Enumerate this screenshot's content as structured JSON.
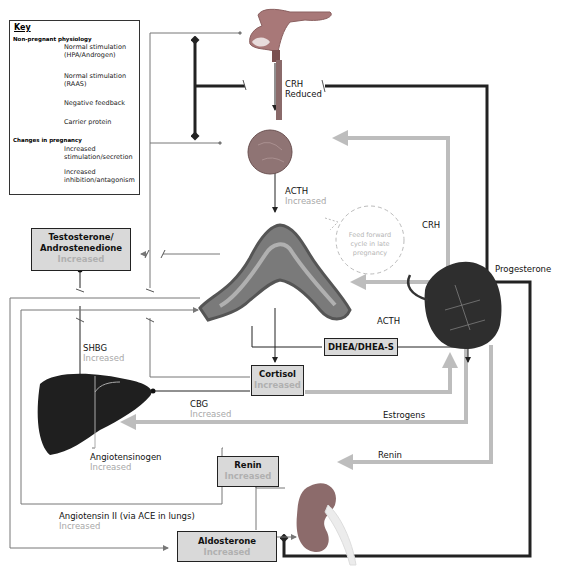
{
  "key": {
    "title": "Key",
    "section_non_pregnant": "Non-pregnant physiology",
    "items_non_pregnant": [
      {
        "label_line1": "Normal stimulation",
        "label_line2": "(HPA/Androgen)",
        "icon": "black-thin-arrow"
      },
      {
        "label_line1": "Normal stimulation",
        "label_line2": "(RAAS)",
        "icon": "grey-thin-arrow"
      },
      {
        "label_line1": "Negative feedback",
        "label_line2": "",
        "icon": "diamond-head-line"
      },
      {
        "label_line1": "Carrier protein",
        "label_line2": "",
        "icon": "dot-head-line"
      }
    ],
    "section_pregnancy": "Changes in pregnancy",
    "items_pregnancy": [
      {
        "label_line1": "Increased",
        "label_line2": "stimulation/secretion",
        "icon": "thick-grey-arrow"
      },
      {
        "label_line1": "Increased",
        "label_line2": "inhibition/antagonism",
        "icon": "thick-black-diamond-line"
      }
    ]
  },
  "labels": {
    "crh_top": "CRH",
    "crh_top_sub": "Reduced",
    "acth_top": "ACTH",
    "acth_top_sub": "Increased",
    "feed_forward_1": "Feed forward",
    "feed_forward_2": "cycle in late",
    "feed_forward_3": "pregnancy",
    "crh_right": "CRH",
    "progesterone": "Progesterone",
    "acth_right": "ACTH",
    "shbg": "SHBG",
    "shbg_sub": "Increased",
    "cbg": "CBG",
    "cbg_sub": "Increased",
    "estrogens": "Estrogens",
    "angiotensinogen": "Angiotensinogen",
    "angiotensinogen_sub": "Increased",
    "renin_arrow": "Renin",
    "angiotensin2": "Angiotensin II (via ACE in lungs)",
    "angiotensin2_sub": "Increased"
  },
  "boxes": {
    "testosterone": {
      "line1": "Testosterone/",
      "line2": "Androstenedione",
      "sub": "Increased"
    },
    "cortisol": {
      "line1": "Cortisol",
      "sub": "Increased"
    },
    "dhea": {
      "line1": "DHEA/DHEA-S"
    },
    "renin": {
      "line1": "Renin",
      "sub": "Increased"
    },
    "aldosterone": {
      "line1": "Aldosterone",
      "sub": "Increased"
    }
  },
  "colors": {
    "thick_grey": "#bdbdbd",
    "dark": "#222222",
    "thin_grey": "#777777",
    "box_fill": "#d9d9d9",
    "increased_text": "#a8a8a8"
  },
  "organs": [
    "hypothalamus",
    "pituitary",
    "adrenal-gland",
    "placenta",
    "liver",
    "kidney"
  ]
}
